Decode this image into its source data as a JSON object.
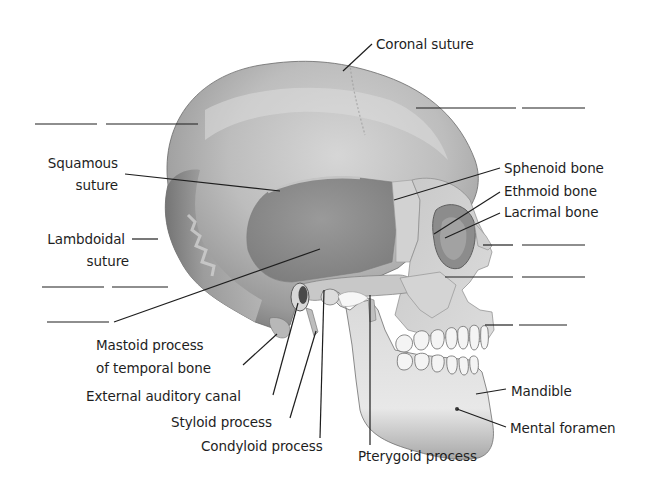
{
  "diagram": {
    "colors": {
      "background": "#ffffff",
      "bone_light": "#e6e6e6",
      "bone_mid": "#b4b4b4",
      "bone_dark": "#7a7a7a",
      "temporal_region": "#8f8f8f",
      "teeth": "#f4f4f4",
      "line": "#1e1e1e",
      "text": "#1e1e1e"
    },
    "labels": {
      "coronal_suture": "Coronal suture",
      "squamous_suture_1": "Squamous",
      "squamous_suture_2": "suture",
      "lambdoidal_suture_1": "Lambdoidal",
      "lambdoidal_suture_2": "suture",
      "sphenoid_bone": "Sphenoid bone",
      "ethmoid_bone": "Ethmoid bone",
      "lacrimal_bone": "Lacrimal bone",
      "mastoid_process_1": "Mastoid process",
      "mastoid_process_2": "of temporal bone",
      "external_auditory_canal": "External auditory canal",
      "styloid_process": "Styloid process",
      "condyloid_process": "Condyloid process",
      "pterygoid_process": "Pterygoid process",
      "mandible": "Mandible",
      "mental_foramen": "Mental foramen"
    },
    "blank_labels": [
      {
        "id": "blank-parietal",
        "side": "left",
        "target": "parietal bone region"
      },
      {
        "id": "blank-frontal",
        "side": "right",
        "target": "frontal bone region"
      },
      {
        "id": "blank-nasal",
        "side": "right",
        "target": "nasal bone"
      },
      {
        "id": "blank-zygomatic",
        "side": "right",
        "target": "zygomatic bone"
      },
      {
        "id": "blank-occipital",
        "side": "left",
        "target": "occipital bone"
      },
      {
        "id": "blank-temporal",
        "side": "left",
        "target": "temporal bone"
      },
      {
        "id": "blank-maxilla",
        "side": "right",
        "target": "maxilla"
      }
    ]
  }
}
